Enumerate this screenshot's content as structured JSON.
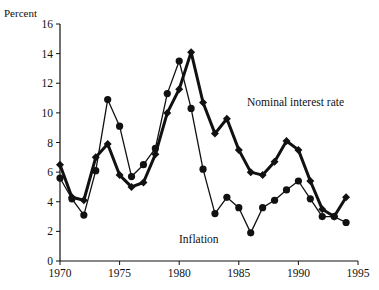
{
  "chart_data": {
    "type": "line",
    "title": "",
    "xlabel": "",
    "ylabel": "Percent",
    "xlim": [
      1970,
      1995
    ],
    "ylim": [
      0,
      16
    ],
    "x_ticks": [
      "1970",
      "1975",
      "1980",
      "1985",
      "1990",
      "1995"
    ],
    "y_ticks": [
      "0",
      "2",
      "4",
      "6",
      "8",
      "10",
      "12",
      "14",
      "16"
    ],
    "grid": false,
    "legend": "inline annotations",
    "x": [
      1970,
      1971,
      1972,
      1973,
      1974,
      1975,
      1976,
      1977,
      1978,
      1979,
      1980,
      1981,
      1982,
      1983,
      1984,
      1985,
      1986,
      1987,
      1988,
      1989,
      1990,
      1991,
      1992,
      1993,
      1994
    ],
    "series": [
      {
        "name": "Nominal interest rate",
        "marker": "diamond",
        "line_width": "thick",
        "values": [
          6.5,
          4.3,
          4.1,
          7.0,
          7.9,
          5.8,
          5.0,
          5.3,
          7.2,
          10.0,
          11.6,
          14.1,
          10.7,
          8.6,
          9.6,
          7.5,
          6.0,
          5.8,
          6.7,
          8.1,
          7.5,
          5.4,
          3.5,
          3.0,
          4.3
        ]
      },
      {
        "name": "Inflation",
        "marker": "circle",
        "line_width": "thin",
        "values": [
          5.6,
          4.2,
          3.1,
          6.1,
          10.9,
          9.1,
          5.7,
          6.5,
          7.6,
          11.3,
          13.5,
          10.3,
          6.2,
          3.2,
          4.3,
          3.6,
          1.9,
          3.6,
          4.1,
          4.8,
          5.4,
          4.2,
          3.0,
          3.0,
          2.6
        ]
      }
    ],
    "annotations": [
      {
        "text": "Nominal interest rate",
        "x": 1984.5,
        "y": 10.6
      },
      {
        "text": "Inflation",
        "x": 1981.3,
        "y": 2.3
      }
    ]
  }
}
